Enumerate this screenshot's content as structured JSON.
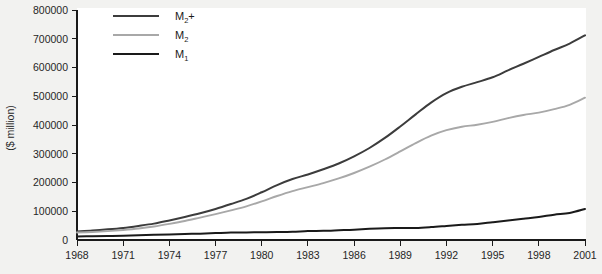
{
  "chart_data": {
    "type": "line",
    "title": "",
    "xlabel": "",
    "ylabel": "($ million)",
    "xlim": [
      1968,
      2001
    ],
    "ylim": [
      0,
      800000
    ],
    "grid": false,
    "legend_position": "top-left",
    "xticks": [
      "1968",
      "1971",
      "1974",
      "1977",
      "1980",
      "1983",
      "1986",
      "1989",
      "1992",
      "1995",
      "1998",
      "2001"
    ],
    "yticks": [
      "0",
      "100000",
      "200000",
      "300000",
      "400000",
      "500000",
      "600000",
      "700000",
      "800000"
    ],
    "x": [
      1968,
      1969,
      1970,
      1971,
      1972,
      1973,
      1974,
      1975,
      1976,
      1977,
      1978,
      1979,
      1980,
      1981,
      1982,
      1983,
      1984,
      1985,
      1986,
      1987,
      1988,
      1989,
      1990,
      1991,
      1992,
      1993,
      1994,
      1995,
      1996,
      1997,
      1998,
      1999,
      2000,
      2001
    ],
    "series": [
      {
        "name": "M2+",
        "color": "#3c3c3c",
        "values": [
          30000,
          33000,
          37000,
          42000,
          49000,
          57000,
          68000,
          80000,
          93000,
          108000,
          125000,
          143000,
          166000,
          191000,
          212000,
          228000,
          246000,
          266000,
          291000,
          320000,
          355000,
          395000,
          437000,
          478000,
          511000,
          533000,
          549000,
          566000,
          590000,
          613000,
          637000,
          661000,
          683000,
          712000
        ]
      },
      {
        "name": "M2",
        "color": "#a8a8a8",
        "values": [
          26000,
          28000,
          31000,
          35000,
          40000,
          47000,
          56000,
          66000,
          78000,
          90000,
          103000,
          117000,
          134000,
          153000,
          170000,
          184000,
          198000,
          214000,
          233000,
          255000,
          280000,
          308000,
          337000,
          363000,
          382000,
          394000,
          401000,
          411000,
          424000,
          435000,
          443000,
          455000,
          470000,
          495000
        ]
      },
      {
        "name": "M1",
        "color": "#1a1a1a",
        "values": [
          12000,
          13000,
          14000,
          15000,
          16500,
          18000,
          19500,
          21000,
          22000,
          24000,
          26000,
          26500,
          27000,
          27500,
          28500,
          31000,
          32000,
          34000,
          36000,
          39000,
          41000,
          41500,
          42000,
          45000,
          49000,
          53000,
          56000,
          62000,
          68000,
          74000,
          80000,
          88000,
          94000,
          108000
        ]
      }
    ]
  },
  "legend": {
    "items": [
      {
        "base": "M",
        "sub": "2",
        "suffix": "+",
        "color": "#3c3c3c"
      },
      {
        "base": "M",
        "sub": "2",
        "suffix": "",
        "color": "#a8a8a8"
      },
      {
        "base": "M",
        "sub": "1",
        "suffix": "",
        "color": "#1a1a1a"
      }
    ]
  },
  "axis": {
    "y_title": "($ million)"
  }
}
